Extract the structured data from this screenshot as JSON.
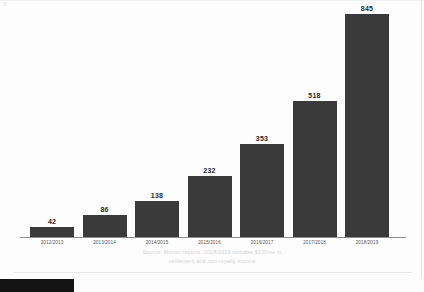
{
  "chart_data": {
    "type": "bar",
    "title": "",
    "subtitle": "",
    "xlabel": "",
    "ylabel": "",
    "ylim": [
      0,
      845
    ],
    "grid": false,
    "legend": false,
    "categories": [
      "2012/2013",
      "2013/2014",
      "2014/2015",
      "2015/2016",
      "2016/2017",
      "2017/2018",
      "2018/2019"
    ],
    "values": [
      42,
      86,
      138,
      232,
      353,
      518,
      845
    ],
    "value_labels": [
      "42",
      "86",
      "138",
      "232",
      "353",
      "518",
      "845"
    ],
    "bar_color": "#3a3a3a",
    "axis_color": "#8d8d8d"
  },
  "annotations": {
    "source_line_1": "Source: Monoo reports. 2018/2019 includes $130m+ in",
    "source_line_2": "settlement and non-royalty income",
    "source_color": "#d2d2d2"
  },
  "footer": {
    "faint_text": "",
    "swatch_color": "#141414"
  }
}
